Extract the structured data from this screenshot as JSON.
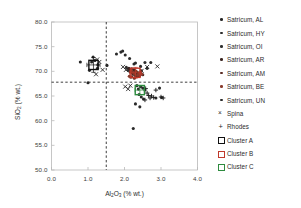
{
  "chart_data": {
    "type": "scatter",
    "title": "",
    "xlabel": "Al2O3 (% wt.)",
    "ylabel": "SiO2 (% wt.)",
    "xlim": [
      0.0,
      4.0
    ],
    "ylim": [
      50.0,
      80.0
    ],
    "xticks": [
      "0.0",
      "1.0",
      "2.0",
      "3.0",
      "4.0"
    ],
    "yticks": [
      "50.0",
      "55.0",
      "60.0",
      "65.0",
      "70.0",
      "75.0",
      "80.0"
    ],
    "grid": false,
    "legend_position": "right",
    "reference_lines": {
      "vertical_x": 1.5,
      "horizontal_y": 67.8,
      "style": "dashed"
    },
    "series": [
      {
        "name": "Satricum, AL",
        "marker": "circle",
        "color": "#262626",
        "points": [
          [
            1.14,
            72.9
          ],
          [
            1.19,
            72.2
          ],
          [
            1.1,
            71.9
          ],
          [
            1.27,
            71.3
          ],
          [
            1.04,
            70.2
          ],
          [
            0.79,
            71.9
          ],
          [
            1.0,
            67.7
          ],
          [
            1.52,
            71.2
          ],
          [
            1.26,
            70.6
          ]
        ]
      },
      {
        "name": "Satricum, HY",
        "marker": "circle",
        "color": "#2b2b2b",
        "points": [
          [
            1.78,
            73.5
          ],
          [
            1.9,
            73.9
          ],
          [
            1.95,
            74.1
          ],
          [
            2.02,
            73.3
          ],
          [
            2.14,
            72.6
          ],
          [
            2.26,
            71.5
          ],
          [
            2.56,
            71.8
          ],
          [
            2.44,
            71.0
          ]
        ]
      },
      {
        "name": "Satricum, OI",
        "marker": "circle",
        "color": "#303030",
        "points": [
          [
            2.05,
            70.8
          ],
          [
            2.1,
            70.2
          ],
          [
            2.15,
            69.9
          ],
          [
            2.2,
            70.5
          ],
          [
            2.24,
            69.4
          ],
          [
            2.28,
            70.0
          ],
          [
            2.31,
            69.1
          ],
          [
            2.35,
            69.7
          ]
        ]
      },
      {
        "name": "Satricum, AR",
        "marker": "circle",
        "color": "#3a2420",
        "points": [
          [
            2.12,
            70.6
          ],
          [
            2.18,
            70.1
          ],
          [
            2.22,
            69.6
          ],
          [
            2.26,
            70.3
          ],
          [
            2.3,
            69.2
          ],
          [
            2.34,
            69.8
          ],
          [
            2.38,
            69.0
          ],
          [
            2.42,
            69.5
          ],
          [
            2.46,
            70.1
          ],
          [
            2.5,
            69.3
          ]
        ]
      },
      {
        "name": "Satricum, AM",
        "marker": "circle",
        "color": "#5a2a22",
        "points": [
          [
            2.16,
            70.4
          ],
          [
            2.21,
            69.9
          ],
          [
            2.25,
            69.5
          ],
          [
            2.29,
            70.1
          ],
          [
            2.33,
            69.3
          ],
          [
            2.37,
            69.7
          ],
          [
            2.41,
            69.1
          ],
          [
            2.45,
            69.6
          ],
          [
            2.2,
            68.9
          ],
          [
            2.27,
            68.6
          ]
        ]
      },
      {
        "name": "Satricum, BE",
        "marker": "circle",
        "color": "#8a3b2c",
        "points": [
          [
            2.19,
            70.2
          ],
          [
            2.24,
            69.8
          ],
          [
            2.28,
            69.4
          ],
          [
            2.32,
            70.0
          ],
          [
            2.36,
            69.2
          ],
          [
            2.4,
            69.6
          ],
          [
            2.13,
            69.0
          ],
          [
            2.17,
            68.8
          ],
          [
            2.44,
            69.9
          ],
          [
            2.48,
            69.4
          ]
        ]
      },
      {
        "name": "Satricum, UN",
        "marker": "circle",
        "color": "#2a2a2a",
        "points": [
          [
            2.3,
            71.7
          ],
          [
            2.62,
            70.6
          ],
          [
            2.72,
            71.8
          ],
          [
            2.34,
            67.1
          ],
          [
            2.44,
            66.9
          ],
          [
            2.5,
            66.6
          ],
          [
            2.38,
            66.4
          ],
          [
            2.56,
            66.2
          ],
          [
            2.4,
            65.3
          ],
          [
            2.46,
            64.8
          ],
          [
            2.52,
            64.4
          ],
          [
            2.3,
            63.4
          ],
          [
            2.42,
            62.8
          ],
          [
            2.24,
            58.4
          ],
          [
            2.96,
            66.6
          ],
          [
            3.02,
            64.7
          ],
          [
            2.86,
            64.6
          ]
        ]
      },
      {
        "name": "Spina",
        "marker": "x",
        "color": "#1f1f1f",
        "points": [
          [
            1.25,
            72.4
          ],
          [
            1.31,
            71.9
          ],
          [
            1.4,
            70.3
          ],
          [
            1.22,
            69.4
          ],
          [
            1.96,
            70.9
          ],
          [
            2.04,
            70.3
          ],
          [
            2.47,
            70.1
          ],
          [
            2.62,
            70.9
          ],
          [
            2.9,
            71.0
          ],
          [
            2.02,
            66.9
          ],
          [
            2.1,
            66.4
          ],
          [
            2.16,
            67.1
          ]
        ]
      },
      {
        "name": "Rhodes",
        "marker": "plus",
        "color": "#1f1f1f",
        "points": [
          [
            2.58,
            66.5
          ],
          [
            2.62,
            65.6
          ],
          [
            2.66,
            65.1
          ],
          [
            2.7,
            64.6
          ],
          [
            2.74,
            65.0
          ],
          [
            2.8,
            64.7
          ],
          [
            3.0,
            64.8
          ],
          [
            3.06,
            64.6
          ],
          [
            2.56,
            64.2
          ],
          [
            2.86,
            66.2
          ]
        ]
      }
    ],
    "clusters": [
      {
        "name": "Cluster A",
        "color": "#111111",
        "x": 1.15,
        "y": 71.3,
        "xerr": 0.18,
        "yerr": 1.5
      },
      {
        "name": "Cluster B",
        "color": "#c0392b",
        "x": 2.3,
        "y": 69.7,
        "xerr": 0.16,
        "yerr": 1.1
      },
      {
        "name": "Cluster C",
        "color": "#2e8b3f",
        "x": 2.42,
        "y": 66.2,
        "xerr": 0.13,
        "yerr": 0.9
      }
    ]
  },
  "legend": {
    "items": [
      {
        "label": "Satricum, AL",
        "glyph": "dot-icon",
        "color": "#262626"
      },
      {
        "label": "Satricum, HY",
        "glyph": "dot-icon",
        "color": "#2b2b2b"
      },
      {
        "label": "Satricum, OI",
        "glyph": "dot-icon",
        "color": "#303030"
      },
      {
        "label": "Satricum, AR",
        "glyph": "dot-icon",
        "color": "#3a2420"
      },
      {
        "label": "Satricum, AM",
        "glyph": "dot-icon",
        "color": "#5a2a22"
      },
      {
        "label": "Satricum, BE",
        "glyph": "dot-icon",
        "color": "#8a3b2c"
      },
      {
        "label": "Satricum, UN",
        "glyph": "dot-icon",
        "color": "#2a2a2a"
      },
      {
        "label": "Spina",
        "glyph": "cross-x-icon",
        "color": "#1f1f1f"
      },
      {
        "label": "Rhodes",
        "glyph": "plus-icon",
        "color": "#1f1f1f"
      },
      {
        "label": "Cluster A",
        "glyph": "open-square-icon",
        "color": "#111111"
      },
      {
        "label": "Cluster B",
        "glyph": "open-square-icon",
        "color": "#c0392b"
      },
      {
        "label": "Cluster C",
        "glyph": "open-square-icon",
        "color": "#2e8b3f"
      }
    ]
  },
  "axes": {
    "xlabel_main": "Al",
    "xlabel_sub1": "2",
    "xlabel_mid": "O",
    "xlabel_sub2": "3",
    "xlabel_unit": " (% wt.)",
    "ylabel_main": "SiO",
    "ylabel_sub": "2",
    "ylabel_unit": " (% wt.)"
  }
}
